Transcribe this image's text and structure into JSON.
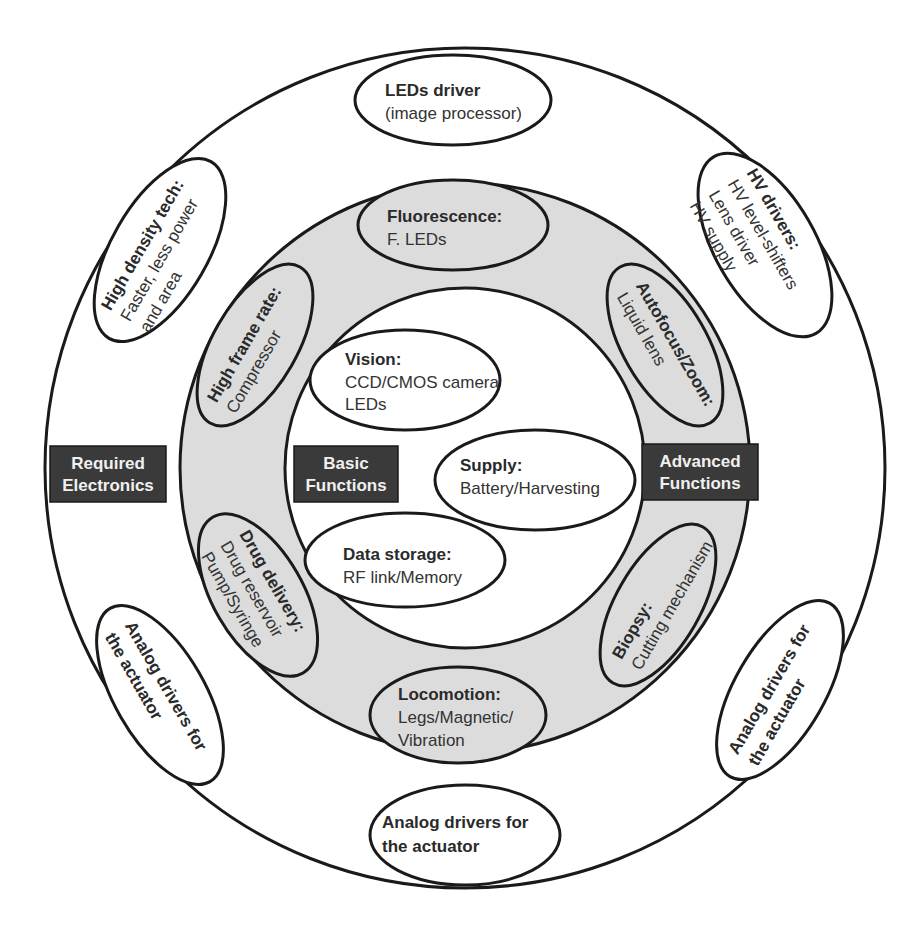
{
  "diagram": {
    "type": "concentric-circle-diagram",
    "colors": {
      "outer_ring_fill": "#ffffff",
      "middle_ring_fill": "#dcdcdc",
      "inner_circle_fill": "#ffffff",
      "stroke": "#1a1a1a",
      "label_box_fill": "#3a3a3a",
      "label_box_text": "#f0f0f0"
    },
    "ring_labels": {
      "outer": [
        "Required",
        "Electronics"
      ],
      "inner": [
        "Basic",
        "Functions"
      ],
      "middle": [
        "Advanced",
        "Functions"
      ]
    },
    "basic_functions": [
      {
        "title": "Vision:",
        "lines": [
          "CCD/CMOS camera",
          "LEDs"
        ]
      },
      {
        "title": "Supply:",
        "lines": [
          "Battery/Harvesting"
        ]
      },
      {
        "title": "Data storage:",
        "lines": [
          "RF link/Memory"
        ]
      }
    ],
    "advanced_functions": [
      {
        "title": "Fluorescence:",
        "lines": [
          "F. LEDs"
        ]
      },
      {
        "title": "Autofocus/Zoom:",
        "lines": [
          "Liquid lens"
        ]
      },
      {
        "title": "Biopsy:",
        "lines": [
          "Cutting mechanism"
        ]
      },
      {
        "title": "Locomotion:",
        "lines": [
          "Legs/Magnetic/",
          "Vibration"
        ]
      },
      {
        "title": "Drug delivery:",
        "lines": [
          "Drug reservoir",
          "Pump/Syringe"
        ]
      },
      {
        "title": "High frame rate:",
        "lines": [
          "Compressor"
        ]
      }
    ],
    "required_electronics": [
      {
        "title": "LEDs driver",
        "lines": [
          "(image processor)"
        ]
      },
      {
        "title": "HV drivers:",
        "lines": [
          "HV level-shifters",
          "Lens driver",
          "HV supply"
        ]
      },
      {
        "title": "Analog drivers for",
        "lines": [
          "the actuator"
        ],
        "position": "right"
      },
      {
        "title": "Analog drivers for",
        "lines": [
          "the actuator"
        ],
        "position": "bottom"
      },
      {
        "title": "Analog drivers for",
        "lines": [
          "the actuator"
        ],
        "position": "left"
      },
      {
        "title": "High density tech:",
        "lines": [
          "Faster, less power",
          "and area"
        ]
      }
    ]
  }
}
